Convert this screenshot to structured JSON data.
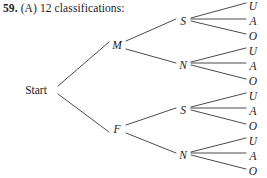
{
  "header": {
    "number": "59.",
    "part": "(A)",
    "text": "12 classifications:"
  },
  "diagram": {
    "type": "tree",
    "root": {
      "id": "start",
      "label": "Start",
      "x": 36,
      "y": 90,
      "anchor": "middle",
      "style": "upright"
    },
    "level1": [
      {
        "id": "m",
        "label": "M",
        "x": 117,
        "y": 45,
        "parent": "start"
      },
      {
        "id": "f",
        "label": "F",
        "x": 117,
        "y": 129,
        "parent": "start"
      }
    ],
    "level2": [
      {
        "id": "m-s",
        "label": "S",
        "x": 183,
        "y": 21,
        "parent": "m"
      },
      {
        "id": "m-n",
        "label": "N",
        "x": 183,
        "y": 65,
        "parent": "m"
      },
      {
        "id": "f-s",
        "label": "S",
        "x": 183,
        "y": 110,
        "parent": "f"
      },
      {
        "id": "f-n",
        "label": "N",
        "x": 183,
        "y": 155,
        "parent": "f"
      }
    ],
    "leaves": [
      {
        "id": "m-s-u",
        "label": "U",
        "x": 253,
        "y": 6,
        "parent": "m-s"
      },
      {
        "id": "m-s-a",
        "label": "A",
        "x": 253,
        "y": 21,
        "parent": "m-s"
      },
      {
        "id": "m-s-o",
        "label": "O",
        "x": 253,
        "y": 36,
        "parent": "m-s"
      },
      {
        "id": "m-n-u",
        "label": "U",
        "x": 253,
        "y": 51,
        "parent": "m-n"
      },
      {
        "id": "m-n-a",
        "label": "A",
        "x": 253,
        "y": 66,
        "parent": "m-n"
      },
      {
        "id": "m-n-o",
        "label": "O",
        "x": 253,
        "y": 81,
        "parent": "m-n"
      },
      {
        "id": "f-s-u",
        "label": "U",
        "x": 253,
        "y": 96,
        "parent": "f-s"
      },
      {
        "id": "f-s-a",
        "label": "A",
        "x": 253,
        "y": 111,
        "parent": "f-s"
      },
      {
        "id": "f-s-o",
        "label": "O",
        "x": 253,
        "y": 126,
        "parent": "f-s"
      },
      {
        "id": "f-n-u",
        "label": "U",
        "x": 253,
        "y": 141,
        "parent": "f-n"
      },
      {
        "id": "f-n-a",
        "label": "A",
        "x": 253,
        "y": 156,
        "parent": "f-n"
      },
      {
        "id": "f-n-o",
        "label": "O",
        "x": 253,
        "y": 171,
        "parent": "f-n"
      }
    ],
    "edges": [
      {
        "id": "edge-start-m",
        "x1": 58,
        "y1": 86,
        "x2": 109,
        "y2": 42
      },
      {
        "id": "edge-start-f",
        "x1": 58,
        "y1": 94,
        "x2": 109,
        "y2": 132
      },
      {
        "id": "edge-m-s",
        "x1": 126,
        "y1": 41,
        "x2": 176,
        "y2": 19
      },
      {
        "id": "edge-m-n",
        "x1": 126,
        "y1": 49,
        "x2": 176,
        "y2": 63
      },
      {
        "id": "edge-f-s",
        "x1": 126,
        "y1": 125,
        "x2": 176,
        "y2": 108
      },
      {
        "id": "edge-f-n",
        "x1": 126,
        "y1": 133,
        "x2": 176,
        "y2": 153
      },
      {
        "id": "edge-ms-u",
        "x1": 191,
        "y1": 18,
        "x2": 246,
        "y2": 3
      },
      {
        "id": "edge-ms-a",
        "x1": 191,
        "y1": 19,
        "x2": 246,
        "y2": 19
      },
      {
        "id": "edge-ms-o",
        "x1": 191,
        "y1": 21,
        "x2": 246,
        "y2": 34
      },
      {
        "id": "edge-mn-u",
        "x1": 191,
        "y1": 62,
        "x2": 246,
        "y2": 48
      },
      {
        "id": "edge-mn-a",
        "x1": 191,
        "y1": 63,
        "x2": 246,
        "y2": 63
      },
      {
        "id": "edge-mn-o",
        "x1": 191,
        "y1": 65,
        "x2": 246,
        "y2": 79
      },
      {
        "id": "edge-fs-u",
        "x1": 191,
        "y1": 107,
        "x2": 246,
        "y2": 93
      },
      {
        "id": "edge-fs-a",
        "x1": 191,
        "y1": 108,
        "x2": 246,
        "y2": 108
      },
      {
        "id": "edge-fs-o",
        "x1": 191,
        "y1": 110,
        "x2": 246,
        "y2": 124
      },
      {
        "id": "edge-fn-u",
        "x1": 191,
        "y1": 152,
        "x2": 246,
        "y2": 138
      },
      {
        "id": "edge-fn-a",
        "x1": 191,
        "y1": 153,
        "x2": 246,
        "y2": 153
      },
      {
        "id": "edge-fn-o",
        "x1": 191,
        "y1": 155,
        "x2": 246,
        "y2": 169
      }
    ]
  }
}
